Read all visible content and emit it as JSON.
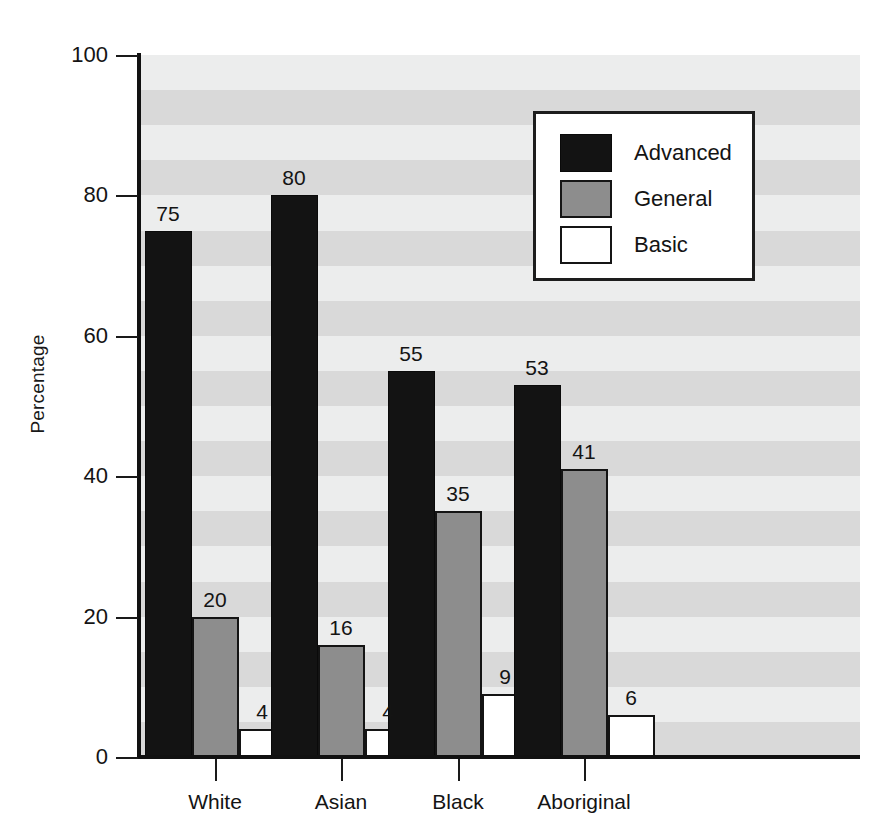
{
  "chart_data": {
    "type": "bar",
    "title": "",
    "xlabel": "",
    "ylabel": "Percentage",
    "ylim": [
      0,
      100
    ],
    "yticks": [
      0,
      20,
      40,
      60,
      80,
      100
    ],
    "ytick_labels": [
      "0",
      "20",
      "40",
      "60",
      "80",
      "100"
    ],
    "grid": "horizontal-alternating-bands",
    "legend_position": "upper-right-inside",
    "categories": [
      "White",
      "Asian",
      "Black",
      "Aboriginal"
    ],
    "series": [
      {
        "name": "Advanced",
        "color": "#131313",
        "values": [
          75,
          80,
          55,
          53
        ]
      },
      {
        "name": "General",
        "color": "#8d8d8d",
        "values": [
          20,
          16,
          35,
          41
        ]
      },
      {
        "name": "Basic",
        "color": "#ffffff",
        "values": [
          4,
          4,
          9,
          6
        ]
      }
    ],
    "data_labels": {
      "White": {
        "Advanced": "75",
        "General": "20",
        "Basic": "4"
      },
      "Asian": {
        "Advanced": "80",
        "General": "16",
        "Basic": "4"
      },
      "Black": {
        "Advanced": "55",
        "General": "35",
        "Basic": "9"
      },
      "Aboriginal": {
        "Advanced": "53",
        "General": "41",
        "Basic": "6"
      }
    }
  },
  "legend": {
    "items": [
      {
        "label": "Advanced",
        "swatch": "advanced"
      },
      {
        "label": "General",
        "swatch": "general"
      },
      {
        "label": "Basic",
        "swatch": "basic"
      }
    ]
  },
  "axes": {
    "y_title": "Percentage",
    "y_tick_labels": [
      "100",
      "80",
      "60",
      "40",
      "20",
      "0"
    ],
    "x_tick_labels": [
      "White",
      "Asian",
      "Black",
      "Aboriginal"
    ]
  },
  "colors": {
    "advanced": "#131313",
    "general": "#8d8d8d",
    "basic": "#ffffff",
    "plot_background": "#f0f0f0",
    "band": "#d9d9d9",
    "axis": "#111111"
  }
}
